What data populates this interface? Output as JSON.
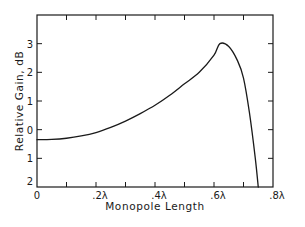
{
  "chart_data": {
    "type": "line",
    "title": "",
    "xlabel": "Monopole Length",
    "ylabel": "Relative Gain, dB",
    "xlim": [
      0,
      0.8
    ],
    "ylim": [
      -2,
      4
    ],
    "x_ticks": [
      0,
      0.1,
      0.2,
      0.3,
      0.4,
      0.5,
      0.6,
      0.7,
      0.8
    ],
    "x_tick_labels": [
      "0",
      ".2λ",
      ".4λ",
      ".6λ",
      ".8λ"
    ],
    "x_tick_label_values": [
      0,
      0.2,
      0.4,
      0.6,
      0.8
    ],
    "y_ticks": [
      -2,
      -1,
      0,
      1,
      2,
      3,
      4
    ],
    "y_tick_labels": [
      "2",
      "1",
      "0",
      "1",
      "2",
      "3"
    ],
    "y_tick_label_values": [
      -2,
      -1,
      0,
      1,
      2,
      3
    ],
    "grid": false,
    "legend": null,
    "series": [
      {
        "name": "Relative Gain",
        "x": [
          0.0,
          0.05,
          0.1,
          0.15,
          0.2,
          0.25,
          0.3,
          0.35,
          0.4,
          0.45,
          0.5,
          0.55,
          0.6,
          0.62,
          0.65,
          0.68,
          0.7,
          0.72,
          0.74,
          0.75
        ],
        "y": [
          -0.35,
          -0.34,
          -0.3,
          -0.22,
          -0.1,
          0.08,
          0.3,
          0.56,
          0.85,
          1.2,
          1.6,
          2.0,
          2.6,
          3.0,
          2.9,
          2.4,
          1.8,
          0.6,
          -1.0,
          -2.0
        ]
      }
    ]
  },
  "labels": {
    "xlabel": "Monopole Length",
    "ylabel": "Relative Gain, dB"
  }
}
